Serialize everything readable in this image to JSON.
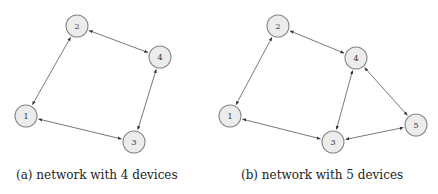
{
  "figures": [
    {
      "id": "a",
      "caption": "(a) network with 4 devices",
      "nodes": [
        {
          "label": "1",
          "x": 26,
          "y": 116
        },
        {
          "label": "2",
          "x": 77,
          "y": 26
        },
        {
          "label": "3",
          "x": 134,
          "y": 142
        },
        {
          "label": "4",
          "x": 160,
          "y": 57
        }
      ],
      "edges": [
        [
          "1",
          "2"
        ],
        [
          "2",
          "4"
        ],
        [
          "4",
          "3"
        ],
        [
          "1",
          "3"
        ]
      ]
    },
    {
      "id": "b",
      "caption": "(b) network with 5 devices",
      "nodes": [
        {
          "label": "1",
          "x": 230,
          "y": 116
        },
        {
          "label": "2",
          "x": 278,
          "y": 26
        },
        {
          "label": "3",
          "x": 333,
          "y": 142
        },
        {
          "label": "4",
          "x": 356,
          "y": 58
        },
        {
          "label": "5",
          "x": 416,
          "y": 125
        }
      ],
      "edges": [
        [
          "1",
          "2"
        ],
        [
          "2",
          "4"
        ],
        [
          "4",
          "3"
        ],
        [
          "1",
          "3"
        ],
        [
          "4",
          "5"
        ],
        [
          "3",
          "5"
        ]
      ]
    }
  ],
  "style": {
    "node_radius": 11,
    "node_fill": "#ececec",
    "node_stroke": "#8a8a8a",
    "edge_color": "#555555"
  }
}
